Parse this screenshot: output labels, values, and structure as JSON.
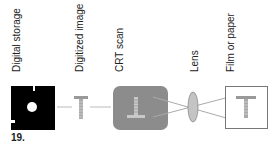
{
  "labels": {
    "digital_storage": "Digital storage",
    "digitized_image": "Digitized image",
    "crt_scan": "CRT scan",
    "lens": "Lens",
    "film_or_paper": "Film or paper"
  },
  "figure_number": "19.",
  "colors": {
    "floppy": "#000000",
    "crt_fill": "#8c8c8c",
    "lens_fill": "#c4c4c4",
    "line": "#a8a8a8",
    "glyph": "#9a9a9a"
  }
}
